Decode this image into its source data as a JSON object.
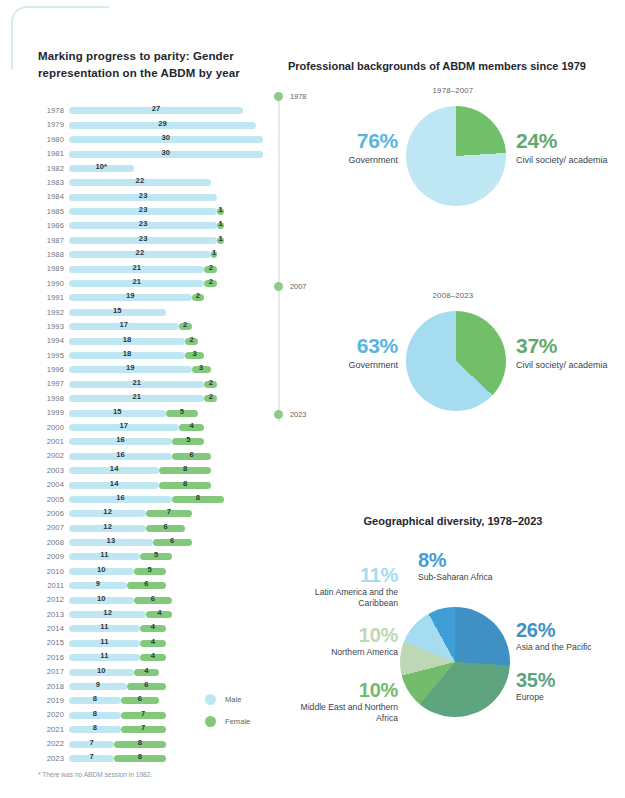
{
  "bar_panel": {
    "title": "Marking progress to parity: Gender representation on the ABDM by year",
    "footnote": "* There was no ABDM session in 1982.",
    "legend": [
      {
        "label": "Male",
        "color": "#bfe7f3"
      },
      {
        "label": "Female",
        "color": "#83c97c"
      }
    ]
  },
  "pie_panel": {
    "title": "Professional backgrounds of ABDM members since 1979",
    "timeline": [
      "1978",
      "2007",
      "2023"
    ],
    "charts": [
      {
        "caption": "1978–2007",
        "left": {
          "pct": "76%",
          "label": "Government"
        },
        "right": {
          "pct": "24%",
          "label": "Civil society/ academia"
        }
      },
      {
        "caption": "2008–2023",
        "left": {
          "pct": "63%",
          "label": "Government"
        },
        "right": {
          "pct": "37%",
          "label": "Civil society/ academia"
        }
      }
    ]
  },
  "geo_panel": {
    "title": "Geographical diversity, 1978–2023",
    "labels": [
      {
        "pct": "8%",
        "name": "Sub-Saharan Africa",
        "color": "#3f9ed6"
      },
      {
        "pct": "26%",
        "name": "Asia and the Pacific",
        "color": "#3f90c4"
      },
      {
        "pct": "35%",
        "name": "Europe",
        "color": "#5ea57f"
      },
      {
        "pct": "10%",
        "name": "Middle East and Northern Africa",
        "color": "#72bc6c"
      },
      {
        "pct": "10%",
        "name": "Northern America",
        "color": "#bcd8b6"
      },
      {
        "pct": "11%",
        "name": "Latin America and the Caribbean",
        "color": "#a6dcf0"
      }
    ]
  },
  "chart_data": [
    {
      "type": "bar",
      "title": "Marking progress to parity: Gender representation on the ABDM by year",
      "orientation": "horizontal",
      "stacked": true,
      "xlabel": "",
      "ylabel": "Year",
      "note": "* There was no ABDM session in 1982.",
      "series": [
        {
          "name": "Male",
          "color": "#bfe7f3"
        },
        {
          "name": "Female",
          "color": "#83c97c"
        }
      ],
      "categories": [
        "1978",
        "1979",
        "1980",
        "1981",
        "1982",
        "1983",
        "1984",
        "1985",
        "1986",
        "1987",
        "1988",
        "1989",
        "1990",
        "1991",
        "1992",
        "1993",
        "1994",
        "1995",
        "1996",
        "1997",
        "1998",
        "1999",
        "2000",
        "2001",
        "2002",
        "2003",
        "2004",
        "2005",
        "2006",
        "2007",
        "2008",
        "2009",
        "2010",
        "2011",
        "2012",
        "2013",
        "2014",
        "2015",
        "2016",
        "2017",
        "2018",
        "2019",
        "2020",
        "2021",
        "2022",
        "2023"
      ],
      "rows": [
        {
          "year": "1978",
          "male": 27,
          "female": 0,
          "male_label": "27",
          "female_label": ""
        },
        {
          "year": "1979",
          "male": 29,
          "female": 0,
          "male_label": "29",
          "female_label": ""
        },
        {
          "year": "1980",
          "male": 30,
          "female": 0,
          "male_label": "30",
          "female_label": ""
        },
        {
          "year": "1981",
          "male": 30,
          "female": 0,
          "male_label": "30",
          "female_label": ""
        },
        {
          "year": "1982",
          "male": 10,
          "female": 0,
          "male_label": "10*",
          "female_label": ""
        },
        {
          "year": "1983",
          "male": 22,
          "female": 0,
          "male_label": "22",
          "female_label": ""
        },
        {
          "year": "1984",
          "male": 23,
          "female": 0,
          "male_label": "23",
          "female_label": ""
        },
        {
          "year": "1985",
          "male": 23,
          "female": 1,
          "male_label": "23",
          "female_label": "1"
        },
        {
          "year": "1986",
          "male": 23,
          "female": 1,
          "male_label": "23",
          "female_label": "1"
        },
        {
          "year": "1987",
          "male": 23,
          "female": 1,
          "male_label": "23",
          "female_label": "1"
        },
        {
          "year": "1988",
          "male": 22,
          "female": 1,
          "male_label": "22",
          "female_label": "1"
        },
        {
          "year": "1989",
          "male": 21,
          "female": 2,
          "male_label": "21",
          "female_label": "2"
        },
        {
          "year": "1990",
          "male": 21,
          "female": 2,
          "male_label": "21",
          "female_label": "2"
        },
        {
          "year": "1991",
          "male": 19,
          "female": 2,
          "male_label": "19",
          "female_label": "2"
        },
        {
          "year": "1992",
          "male": 15,
          "female": 0,
          "male_label": "15",
          "female_label": ""
        },
        {
          "year": "1993",
          "male": 17,
          "female": 2,
          "male_label": "17",
          "female_label": "2"
        },
        {
          "year": "1994",
          "male": 18,
          "female": 2,
          "male_label": "18",
          "female_label": "2"
        },
        {
          "year": "1995",
          "male": 18,
          "female": 3,
          "male_label": "18",
          "female_label": "3"
        },
        {
          "year": "1996",
          "male": 19,
          "female": 3,
          "male_label": "19",
          "female_label": "3"
        },
        {
          "year": "1997",
          "male": 21,
          "female": 2,
          "male_label": "21",
          "female_label": "2"
        },
        {
          "year": "1998",
          "male": 21,
          "female": 2,
          "male_label": "21",
          "female_label": "2"
        },
        {
          "year": "1999",
          "male": 15,
          "female": 5,
          "male_label": "15",
          "female_label": "5"
        },
        {
          "year": "2000",
          "male": 17,
          "female": 4,
          "male_label": "17",
          "female_label": "4"
        },
        {
          "year": "2001",
          "male": 16,
          "female": 5,
          "male_label": "16",
          "female_label": "5"
        },
        {
          "year": "2002",
          "male": 16,
          "female": 6,
          "male_label": "16",
          "female_label": "6"
        },
        {
          "year": "2003",
          "male": 14,
          "female": 8,
          "male_label": "14",
          "female_label": "8"
        },
        {
          "year": "2004",
          "male": 14,
          "female": 8,
          "male_label": "14",
          "female_label": "8"
        },
        {
          "year": "2005",
          "male": 16,
          "female": 8,
          "male_label": "16",
          "female_label": "8"
        },
        {
          "year": "2006",
          "male": 12,
          "female": 7,
          "male_label": "12",
          "female_label": "7"
        },
        {
          "year": "2007",
          "male": 12,
          "female": 6,
          "male_label": "12",
          "female_label": "6"
        },
        {
          "year": "2008",
          "male": 13,
          "female": 6,
          "male_label": "13",
          "female_label": "6"
        },
        {
          "year": "2009",
          "male": 11,
          "female": 5,
          "male_label": "11",
          "female_label": "5"
        },
        {
          "year": "2010",
          "male": 10,
          "female": 5,
          "male_label": "10",
          "female_label": "5"
        },
        {
          "year": "2011",
          "male": 9,
          "female": 6,
          "male_label": "9",
          "female_label": "6"
        },
        {
          "year": "2012",
          "male": 10,
          "female": 6,
          "male_label": "10",
          "female_label": "6"
        },
        {
          "year": "2013",
          "male": 12,
          "female": 4,
          "male_label": "12",
          "female_label": "4"
        },
        {
          "year": "2014",
          "male": 11,
          "female": 4,
          "male_label": "11",
          "female_label": "4"
        },
        {
          "year": "2015",
          "male": 11,
          "female": 4,
          "male_label": "11",
          "female_label": "4"
        },
        {
          "year": "2016",
          "male": 11,
          "female": 4,
          "male_label": "11",
          "female_label": "4"
        },
        {
          "year": "2017",
          "male": 10,
          "female": 4,
          "male_label": "10",
          "female_label": "4"
        },
        {
          "year": "2018",
          "male": 9,
          "female": 6,
          "male_label": "9",
          "female_label": "6"
        },
        {
          "year": "2019",
          "male": 8,
          "female": 6,
          "male_label": "8",
          "female_label": "6"
        },
        {
          "year": "2020",
          "male": 8,
          "female": 7,
          "male_label": "8",
          "female_label": "7"
        },
        {
          "year": "2021",
          "male": 8,
          "female": 7,
          "male_label": "8",
          "female_label": "7"
        },
        {
          "year": "2022",
          "male": 7,
          "female": 8,
          "male_label": "7",
          "female_label": "8"
        },
        {
          "year": "2023",
          "male": 7,
          "female": 8,
          "male_label": "7",
          "female_label": "8"
        }
      ]
    },
    {
      "type": "pie",
      "title": "Professional backgrounds of ABDM members since 1979",
      "subtitle": "1978–2007",
      "labels": [
        "Government",
        "Civil society/academia"
      ],
      "values": [
        76,
        24
      ],
      "colors": [
        "#bfe7f3",
        "#72bf6a"
      ]
    },
    {
      "type": "pie",
      "title": "Professional backgrounds of ABDM members since 1979",
      "subtitle": "2008–2023",
      "labels": [
        "Government",
        "Civil society/academia"
      ],
      "values": [
        63,
        37
      ],
      "colors": [
        "#a6dcf0",
        "#72bf6a"
      ]
    },
    {
      "type": "pie",
      "title": "Geographical diversity, 1978–2023",
      "labels": [
        "Asia and the Pacific",
        "Europe",
        "Middle East and Northern Africa",
        "Northern America",
        "Latin America and the Caribbean",
        "Sub-Saharan Africa"
      ],
      "values": [
        26,
        35,
        10,
        10,
        11,
        8
      ],
      "colors": [
        "#3f90c4",
        "#5ea57f",
        "#72bc6c",
        "#bcd8b6",
        "#a6dcf0",
        "#3f9ed6"
      ]
    }
  ]
}
